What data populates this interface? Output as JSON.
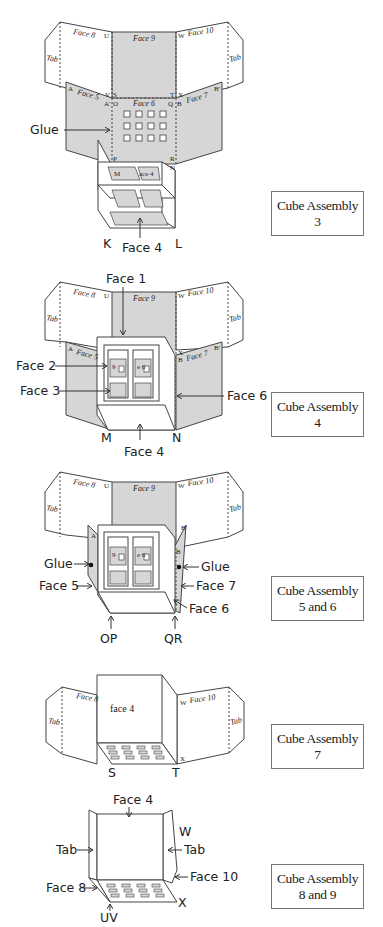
{
  "figure": {
    "steps": [
      {
        "caption_line1": "Cube Assembly",
        "caption_line2": "3",
        "net_labels": {
          "face8": "Face 8",
          "face9": "Face 9",
          "face10": "Face 10",
          "tab_left": "Tab",
          "tab_right": "Tab",
          "face5": "Face 5",
          "face6": "Face 6",
          "face7": "Face 7",
          "U": "U",
          "W": "W",
          "A": "A",
          "A2": "A'",
          "B": "B",
          "B2": "B'",
          "S": "S",
          "T": "T",
          "V": "V",
          "X": "X",
          "O": "O",
          "Q": "Q",
          "P": "P",
          "R": "R",
          "M": "M",
          "N": "N",
          "face4_inner": "ace 4"
        },
        "callouts": {
          "glue": "Glue",
          "face4": "Face 4",
          "K": "K",
          "L": "L"
        }
      },
      {
        "caption_line1": "Cube Assembly",
        "caption_line2": "4",
        "net_labels": {
          "face8": "Face 8",
          "face9": "Face 9",
          "face10": "Face 10",
          "tab_left": "Tab",
          "tab_right": "Tab",
          "face5": "Face 5",
          "face7": "Face 7",
          "U": "U",
          "W": "W",
          "A": "A",
          "B": "B",
          "B2": "B'",
          "X": "X",
          "inner_a": "9",
          "inner_b": "e 6"
        },
        "callouts": {
          "face1": "Face 1",
          "face2": "Face 2",
          "face3": "Face 3",
          "face6": "Face 6",
          "face4": "Face 4",
          "M": "M",
          "N": "N"
        }
      },
      {
        "caption_line1": "Cube Assembly",
        "caption_line2": "5 and 6",
        "net_labels": {
          "face8": "Face 8",
          "face9": "Face 9",
          "face10": "Face 10",
          "tab_left": "Tab",
          "tab_right": "Tab",
          "U": "U",
          "W": "W",
          "A": "A",
          "B": "B",
          "B2": "B'",
          "inner_a": "9",
          "inner_b": "e 6"
        },
        "callouts": {
          "glue_left": "Glue",
          "glue_right": "Glue",
          "face5": "Face 5",
          "face7": "Face 7",
          "face6": "Face 6",
          "OP": "OP",
          "QR": "QR"
        }
      },
      {
        "caption_line1": "Cube Assembly",
        "caption_line2": "7",
        "net_labels": {
          "face8": "Face 8",
          "face10": "Face 10",
          "tab_left": "Tab",
          "tab_right": "Tab",
          "W": "W",
          "X": "X",
          "face4": "face 4"
        },
        "callouts": {
          "S": "S",
          "T": "T"
        }
      },
      {
        "caption_line1": "Cube Assembly",
        "caption_line2": "8 and 9",
        "net_labels": {
          "W": "W",
          "X": "X"
        },
        "callouts": {
          "face4": "Face 4",
          "tab_left": "Tab",
          "tab_right": "Tab",
          "face8": "Face 8",
          "face10": "Face 10",
          "UV": "UV"
        }
      }
    ]
  },
  "colors": {
    "shade": "#d6d6d6",
    "line": "#444444",
    "background": "#ffffff"
  }
}
